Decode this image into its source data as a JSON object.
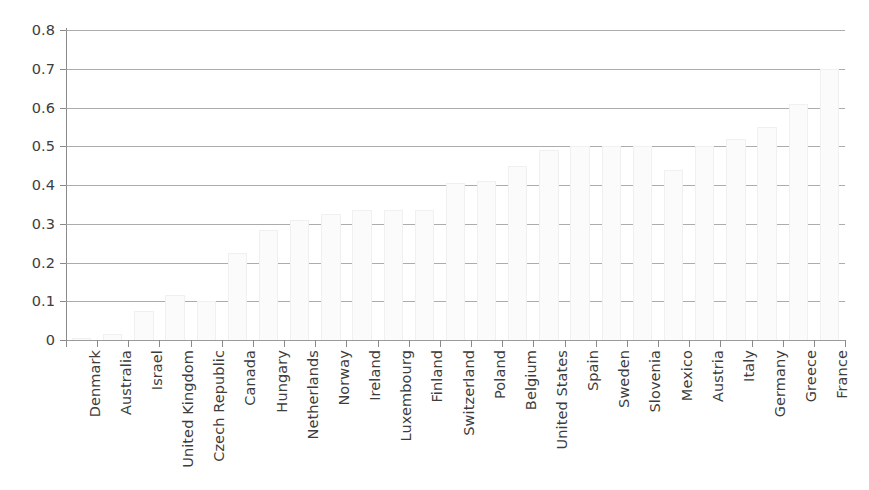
{
  "chart_data": {
    "type": "bar",
    "title": "",
    "subtitle": "",
    "xlabel": "",
    "ylabel": "",
    "ylim": [
      0,
      0.8
    ],
    "ytick_labels": [
      "0.8",
      "0.7",
      "0.6",
      "0.5",
      "0.4",
      "0.3",
      "0.2",
      "0.1",
      "0"
    ],
    "ytick_values": [
      0.8,
      0.7,
      0.6,
      0.5,
      0.4,
      0.3,
      0.2,
      0.1,
      0
    ],
    "grid": true,
    "legend": null,
    "legend_position": "none",
    "annotations": [],
    "bar_color": "#fbfbfb",
    "bar_border_color": "#f0f0f0",
    "gridline_color": "#9e9e9e",
    "axis_color": "#8a8a8a",
    "text_color": "#3d3d3d",
    "categories": [
      "Denmark",
      "Australia",
      "Israel",
      "United Kingdom",
      "Czech Republic",
      "Canada",
      "Hungary",
      "Netherlands",
      "Norway",
      "Ireland",
      "Luxembourg",
      "Finland",
      "Switzerland",
      "Poland",
      "Belgium",
      "United States",
      "Spain",
      "Sweden",
      "Slovenia",
      "Mexico",
      "Austria",
      "Italy",
      "Germany",
      "Greece",
      "France"
    ],
    "values": [
      0.005,
      0.015,
      0.075,
      0.115,
      0.1,
      0.225,
      0.285,
      0.31,
      0.325,
      0.335,
      0.335,
      0.335,
      0.405,
      0.41,
      0.45,
      0.49,
      0.5,
      0.5,
      0.5,
      0.44,
      0.5,
      0.52,
      0.55,
      0.61,
      0.7
    ]
  }
}
